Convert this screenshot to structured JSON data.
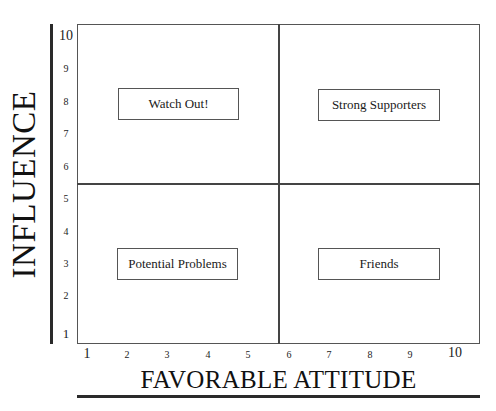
{
  "diagram": {
    "type": "quadrant-matrix",
    "y_axis": {
      "title": "INFLUENCE",
      "ticks": [
        "10",
        "9",
        "8",
        "7",
        "6",
        "5",
        "4",
        "3",
        "2",
        "1"
      ]
    },
    "x_axis": {
      "title": "FAVORABLE ATTITUDE",
      "ticks": [
        "1",
        "2",
        "3",
        "4",
        "5",
        "6",
        "7",
        "8",
        "9",
        "10"
      ]
    },
    "quadrants": [
      {
        "position": "top-left",
        "label": "Watch Out!"
      },
      {
        "position": "top-right",
        "label": "Strong Supporters"
      },
      {
        "position": "bottom-left",
        "label": "Potential Problems"
      },
      {
        "position": "bottom-right",
        "label": "Friends"
      }
    ]
  }
}
